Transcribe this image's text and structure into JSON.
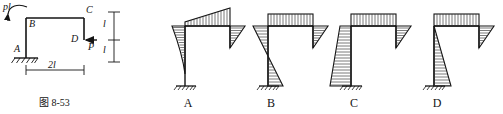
{
  "figure": {
    "caption": "图 8-53",
    "frame": {
      "joint_labels": [
        {
          "name": "A",
          "text": "A",
          "role": "fixed-support-node"
        },
        {
          "name": "B",
          "text": "B",
          "role": "upper-left-corner-node"
        },
        {
          "name": "C",
          "text": "C",
          "role": "upper-right-corner-node"
        },
        {
          "name": "D",
          "text": "D",
          "role": "load-application-node"
        }
      ],
      "loads": [
        {
          "name": "moment-pl",
          "text": "pl",
          "type": "couple",
          "sense": "counterclockwise",
          "at": "B"
        },
        {
          "name": "force-p",
          "text": "P",
          "type": "point-force",
          "direction": "leftward",
          "at": "D"
        }
      ],
      "dimensions": [
        {
          "name": "span-horizontal",
          "text": "2l",
          "orientation": "horizontal"
        },
        {
          "name": "height-upper",
          "text": "l",
          "orientation": "vertical"
        },
        {
          "name": "height-lower",
          "text": "l",
          "orientation": "vertical"
        }
      ],
      "support": {
        "name": "fixed-support",
        "type": "fixed",
        "at": "A"
      }
    },
    "options": [
      {
        "key": "A",
        "label": "A",
        "description": "left column curved moment tapering to zero at base, beam linear, right column triangle"
      },
      {
        "key": "B",
        "label": "B",
        "description": "uniform beam block, bowtie on left column, triangles on right"
      },
      {
        "key": "C",
        "label": "C",
        "description": "uniform beam block, trapezoid on left column, triangle on right column"
      },
      {
        "key": "D",
        "label": "D",
        "description": "uniform beam block, triangle widening to base on left column, triangle on right column"
      }
    ]
  },
  "colors": {
    "ink": "#141414",
    "hatch": "#333333",
    "paper": "#ffffff"
  }
}
